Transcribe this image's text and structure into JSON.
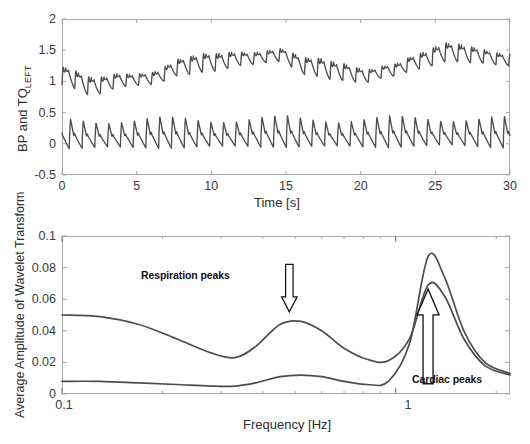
{
  "figure": {
    "background": "#ffffff",
    "trace_color": "#4d4d4d",
    "axis_color": "#a9a9a9",
    "annotation_color": "#111111"
  },
  "panels": [
    {
      "id": "top",
      "name": "time-series-panel",
      "ylabel_main": "BP and TQ",
      "ylabel_sub": "LEFT",
      "xlabel": "Time [s]",
      "xticks": [
        "0",
        "5",
        "10",
        "15",
        "20",
        "25",
        "30"
      ],
      "yticks": [
        "2",
        "1.5",
        "1",
        "0.5",
        "0",
        "-0.5"
      ]
    },
    {
      "id": "bottom",
      "name": "wavelet-spectrum-panel",
      "ylabel": "Average Amplitude of Wavelet Transform",
      "xlabel": "Frequency [Hz]",
      "xticks": [
        "0.1",
        "1"
      ],
      "yticks": [
        "0.1",
        "0.08",
        "0.06",
        "0.04",
        "0.02",
        "0"
      ],
      "annotations": [
        {
          "name": "respiration-peaks-label",
          "text": "Respiration peaks"
        },
        {
          "name": "cardiac-peaks-label",
          "text": "Cardiac peaks"
        }
      ]
    }
  ],
  "chart_data": [
    {
      "type": "line",
      "name": "time-series",
      "title": "",
      "xlabel": "Time [s]",
      "ylabel": "BP and TQ_LEFT",
      "xlim": [
        0,
        30
      ],
      "ylim": [
        -0.5,
        2
      ],
      "xticks": [
        0,
        5,
        10,
        15,
        20,
        25,
        30
      ],
      "yticks": [
        -0.5,
        0,
        0.5,
        1,
        1.5,
        2
      ],
      "grid": false,
      "legend": "none",
      "series": [
        {
          "name": "TQ_LEFT",
          "color": "#4d4d4d",
          "description": "Upper pulsatile trace, slow respiratory baseline drift with ~1.1 Hz cardiac ripple",
          "baseline_x": [
            0,
            2,
            4.2,
            6,
            8,
            10,
            12.2,
            14.5,
            16.5,
            18.5,
            20.2,
            22,
            24,
            25.8,
            27.5,
            30
          ],
          "baseline_y": [
            1.05,
            0.88,
            1.02,
            1.05,
            1.2,
            1.26,
            1.36,
            1.42,
            1.2,
            1.12,
            1.08,
            1.18,
            1.3,
            1.42,
            1.4,
            1.35
          ],
          "pulse_amplitude": 0.28,
          "pulse_rate_hz": 1.17
        },
        {
          "name": "BP",
          "color": "#4d4d4d",
          "description": "Lower pulsatile trace centred near 0 with sharp systolic upstrokes",
          "baseline_x": [
            0,
            5,
            10,
            15,
            20,
            25,
            30
          ],
          "baseline_y": [
            0.03,
            0.04,
            0.05,
            0.06,
            0.05,
            0.07,
            0.05
          ],
          "pulse_amplitude": 0.38,
          "pulse_rate_hz": 1.17
        }
      ]
    },
    {
      "type": "line",
      "name": "wavelet-amplitude-spectrum",
      "title": "",
      "xlabel": "Frequency [Hz]",
      "ylabel": "Average Amplitude of Wavelet Transform",
      "xscale": "log",
      "xlim": [
        0.1,
        2.2
      ],
      "ylim": [
        0,
        0.1
      ],
      "xticks": [
        0.1,
        1
      ],
      "yticks": [
        0,
        0.02,
        0.04,
        0.06,
        0.08,
        0.1
      ],
      "grid": false,
      "legend": "none",
      "series": [
        {
          "name": "upper-spectrum",
          "color": "#4d4d4d",
          "x": [
            0.1,
            0.13,
            0.17,
            0.22,
            0.28,
            0.33,
            0.38,
            0.45,
            0.52,
            0.6,
            0.7,
            0.82,
            0.95,
            1.1,
            1.25,
            1.4,
            1.6,
            1.85,
            2.2
          ],
          "y": [
            0.05,
            0.049,
            0.044,
            0.035,
            0.026,
            0.023,
            0.03,
            0.044,
            0.046,
            0.04,
            0.029,
            0.022,
            0.021,
            0.035,
            0.069,
            0.062,
            0.035,
            0.018,
            0.012
          ],
          "respiration_peak": {
            "freq": 0.48,
            "amplitude": 0.046
          },
          "cardiac_peak": {
            "freq": 1.25,
            "amplitude": 0.069
          }
        },
        {
          "name": "lower-spectrum",
          "color": "#4d4d4d",
          "x": [
            0.1,
            0.13,
            0.17,
            0.22,
            0.28,
            0.33,
            0.38,
            0.45,
            0.52,
            0.6,
            0.7,
            0.82,
            0.95,
            1.1,
            1.25,
            1.4,
            1.6,
            1.85,
            2.2
          ],
          "y": [
            0.008,
            0.008,
            0.007,
            0.006,
            0.005,
            0.005,
            0.007,
            0.011,
            0.012,
            0.011,
            0.008,
            0.006,
            0.008,
            0.032,
            0.087,
            0.074,
            0.04,
            0.02,
            0.013
          ],
          "respiration_peak": {
            "freq": 0.5,
            "amplitude": 0.012
          },
          "cardiac_peak": {
            "freq": 1.25,
            "amplitude": 0.087
          }
        }
      ],
      "annotations": [
        {
          "text": "Respiration peaks",
          "arrow": "down",
          "points_to_freq": 0.48,
          "points_to_amplitude": 0.046
        },
        {
          "text": "Cardiac peaks",
          "arrow": "up",
          "points_to_freq": 1.25,
          "points_to_amplitude": 0.069
        }
      ]
    }
  ]
}
